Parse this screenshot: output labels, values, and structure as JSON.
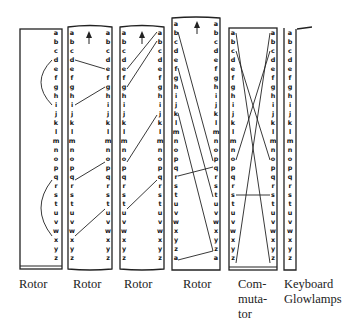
{
  "letters_26": [
    "a",
    "b",
    "c",
    "d",
    "e",
    "f",
    "g",
    "h",
    "i",
    "j",
    "k",
    "l",
    "m",
    "n",
    "o",
    "p",
    "q",
    "r",
    "s",
    "t",
    "u",
    "v",
    "w",
    "x",
    "y",
    "z"
  ],
  "letters_27": [
    "a",
    "b",
    "c",
    "d",
    "e",
    "f",
    "g",
    "h",
    "i",
    "j",
    "k",
    "l",
    "m",
    "n",
    "o",
    "p",
    "q",
    "r",
    "s",
    "t",
    "u",
    "v",
    "w",
    "x",
    "y",
    "z",
    "a"
  ],
  "components": [
    {
      "id": "rotor-1",
      "label": "Rotor",
      "type": "reflector",
      "wires": [
        [
          "d",
          "j"
        ],
        [
          "q",
          "x"
        ]
      ]
    },
    {
      "id": "rotor-2",
      "label": "Rotor",
      "has_arrow": true,
      "wires": [
        [
          "d",
          "e"
        ],
        [
          "i",
          "g"
        ],
        [
          "q",
          "o"
        ],
        [
          "x",
          "u"
        ]
      ]
    },
    {
      "id": "rotor-3",
      "label": "Rotor",
      "has_arrow": true,
      "wires": [
        [
          "e",
          "a"
        ],
        [
          "g",
          "b"
        ],
        [
          "o",
          "j"
        ],
        [
          "u",
          "q"
        ]
      ]
    },
    {
      "id": "rotor-4",
      "label": "Rotor",
      "has_arrow": true,
      "wires": [
        [
          "b",
          "p"
        ],
        [
          "f",
          "t"
        ],
        [
          "k",
          "z"
        ],
        [
          "r",
          "q"
        ],
        [
          "a2",
          "z"
        ]
      ]
    },
    {
      "id": "commutator",
      "label_lines": [
        "Com-",
        "muta-",
        "tor"
      ],
      "wires": [
        [
          "a",
          "z"
        ],
        [
          "c",
          "o"
        ],
        [
          "z",
          "a"
        ],
        [
          "o",
          "c"
        ],
        [
          "s",
          "s"
        ]
      ]
    },
    {
      "id": "keyboard",
      "label_lines": [
        "Keyboard",
        "Glowlamps"
      ]
    }
  ],
  "labels": {
    "rotor1": "Rotor",
    "rotor2": "Rotor",
    "rotor3": "Rotor",
    "rotor4": "Rotor",
    "commutator_1": "Com-",
    "commutator_2": "muta-",
    "commutator_3": "tor",
    "keyboard_1": "Keyboard",
    "keyboard_2": "Glowlamps"
  },
  "icons": {
    "arrow": "up-arrow-icon"
  }
}
